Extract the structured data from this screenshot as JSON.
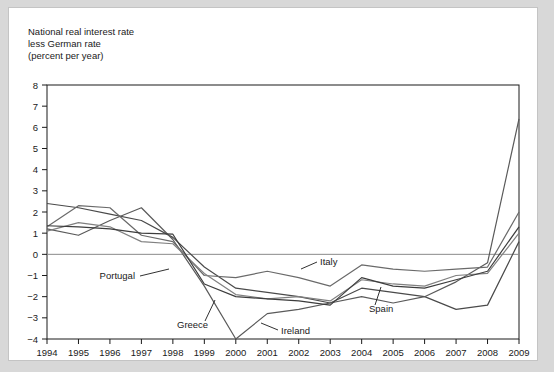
{
  "chart_data": {
    "type": "line",
    "title": "National real interest rate\nless German rate\n(percent per year)",
    "title_lines": [
      "National real interest rate",
      "less German rate",
      "(percent per year)"
    ],
    "xlabel": "",
    "ylabel": "",
    "x": [
      1994,
      1995,
      1996,
      1997,
      1998,
      1999,
      2000,
      2001,
      2002,
      2003,
      2004,
      2005,
      2006,
      2007,
      2008,
      2009
    ],
    "xtick_labels": [
      "1994",
      "1995",
      "1996",
      "1997",
      "1998",
      "1999",
      "2000",
      "2001",
      "2002",
      "2003",
      "2004",
      "2005",
      "2006",
      "2007",
      "2008",
      "2009"
    ],
    "ytick_labels": [
      "8",
      "7",
      "6",
      "5",
      "4",
      "3",
      "2",
      "1",
      "0",
      "-1",
      "-2",
      "-3",
      "-4"
    ],
    "ylim": [
      -4,
      8
    ],
    "xlim": [
      1994,
      2009
    ],
    "ytick_step": 1,
    "grid": false,
    "zero_line": true,
    "legend": "inline-labels",
    "series": [
      {
        "name": "Greece",
        "color": "#4a4a4a",
        "values": [
          2.4,
          2.2,
          1.9,
          1.6,
          0.8,
          -0.6,
          -1.6,
          -1.8,
          -2.0,
          -2.3,
          -1.6,
          -1.8,
          -2.0,
          -2.6,
          -2.4,
          0.6
        ]
      },
      {
        "name": "Ireland",
        "color": "#5a5a5a",
        "values": [
          1.2,
          0.9,
          1.6,
          2.2,
          0.7,
          -1.5,
          -4.0,
          -2.8,
          -2.6,
          -2.3,
          -2.0,
          -2.3,
          -2.0,
          -1.3,
          -0.4,
          6.4
        ]
      },
      {
        "name": "Italy",
        "color": "#6a6a6a",
        "values": [
          1.3,
          2.3,
          2.2,
          0.9,
          0.6,
          -1.0,
          -1.1,
          -0.8,
          -1.1,
          -1.5,
          -0.5,
          -0.7,
          -0.8,
          -0.7,
          -0.6,
          2.0
        ]
      },
      {
        "name": "Portugal",
        "color": "#808080",
        "values": [
          1.1,
          1.5,
          1.3,
          0.6,
          0.5,
          -0.9,
          -1.9,
          -2.1,
          -2.0,
          -2.2,
          -1.2,
          -1.4,
          -1.5,
          -1.0,
          -0.9,
          1.0
        ]
      },
      {
        "name": "Spain",
        "color": "#3d3d3d",
        "values": [
          1.35,
          1.3,
          1.2,
          1.0,
          0.95,
          -1.4,
          -2.0,
          -2.1,
          -2.2,
          -2.4,
          -1.1,
          -1.5,
          -1.6,
          -1.2,
          -0.8,
          1.3
        ]
      }
    ],
    "annotations": [
      {
        "label": "Portugal",
        "text_x": 126,
        "text_y": 271,
        "anchor": "end",
        "leader": [
          [
            131,
            268
          ],
          [
            160,
            261
          ]
        ]
      },
      {
        "label": "Greece",
        "text_x": 168,
        "text_y": 320,
        "anchor": "start",
        "leader": [
          [
            196,
            313
          ],
          [
            206,
            292
          ]
        ]
      },
      {
        "label": "Ireland",
        "text_x": 272,
        "text_y": 326,
        "anchor": "start",
        "leader": [
          [
            269,
            322
          ],
          [
            252,
            315
          ]
        ]
      },
      {
        "label": "Italy",
        "text_x": 311,
        "text_y": 257,
        "anchor": "start",
        "leader": [
          [
            308,
            254
          ],
          [
            292,
            261
          ]
        ]
      },
      {
        "label": "Spain",
        "text_x": 360,
        "text_y": 304,
        "anchor": "start",
        "leader": [
          [
            366,
            297
          ],
          [
            372,
            279
          ]
        ]
      }
    ]
  }
}
